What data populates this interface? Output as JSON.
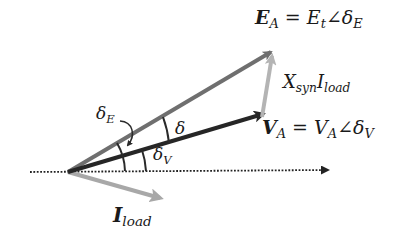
{
  "diagram": {
    "colors": {
      "background": "#ffffff",
      "E_vector": "#6f6f6f",
      "V_vector": "#262626",
      "X_I_vector": "#b4b4b4",
      "I_vector": "#a8a8a8",
      "axis": "#222222",
      "arc": "#2a2a2a",
      "text": "#1a1a1a"
    },
    "origin": {
      "x": 68,
      "y": 172
    },
    "vectors": [
      {
        "name": "E_A",
        "from": [
          68,
          172
        ],
        "to": [
          274,
          50
        ],
        "color": "#6f6f6f"
      },
      {
        "name": "V_A",
        "from": [
          68,
          172
        ],
        "to": [
          266,
          113
        ],
        "color": "#262626"
      },
      {
        "name": "X_syn_I_load",
        "from": [
          262,
          116
        ],
        "to": [
          273,
          54
        ],
        "color": "#b4b4b4"
      },
      {
        "name": "I_load",
        "from": [
          68,
          172
        ],
        "to": [
          163,
          199
        ],
        "color": "#a8a8a8"
      }
    ],
    "reference_axis": {
      "from": [
        30,
        172
      ],
      "to": [
        330,
        170
      ],
      "style": "dotted"
    },
    "labels": {
      "E_A": {
        "symbol": "E",
        "symbol_sub": "A",
        "equals": " = ",
        "magnitude": "E",
        "magnitude_sub": "t",
        "angle": "∠δ",
        "angle_sub": "E"
      },
      "V_A": {
        "symbol": "V",
        "symbol_sub": "A",
        "equals": " = ",
        "magnitude": "V",
        "magnitude_sub": "A",
        "angle": "∠δ",
        "angle_sub": "V"
      },
      "X_I": {
        "x": "X",
        "x_sub": "syn",
        "i": "I",
        "i_sub": "load"
      },
      "I_load": {
        "symbol": "I",
        "symbol_sub": "load"
      },
      "delta": "δ",
      "delta_V": {
        "symbol": "δ",
        "sub": "V"
      },
      "delta_E": {
        "symbol": "δ",
        "sub": "E"
      }
    }
  }
}
